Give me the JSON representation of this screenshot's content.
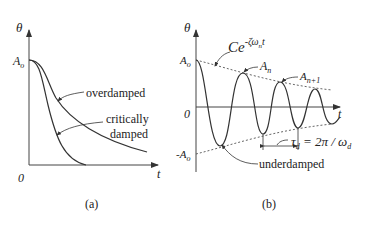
{
  "panel_a": {
    "caption": "(a)",
    "y_axis_label": "θ",
    "x_axis_label": "t",
    "origin_label": "0",
    "amplitude_label": "A",
    "amplitude_sub": "o",
    "curves": [
      {
        "name": "overdamped",
        "label": "overdamped"
      },
      {
        "name": "critically-damped",
        "label_line1": "critically",
        "label_line2": "damped"
      }
    ]
  },
  "panel_b": {
    "caption": "(b)",
    "y_axis_label": "θ",
    "x_axis_label": "t",
    "origin_label": "0",
    "amp_pos": {
      "main": "A",
      "sub": "o"
    },
    "amp_neg": {
      "main": "-A",
      "sub": "o"
    },
    "envelope": {
      "main": "Ce",
      "sup": "-ζω",
      "sup_sub": "n",
      "sup_end": "t"
    },
    "peak_n": {
      "main": "A",
      "sub": "n"
    },
    "peak_n1": {
      "main": "A",
      "sub": "n+1"
    },
    "period": {
      "tau": "τ",
      "tau_sub": "d",
      "eq": " = 2π / ω",
      "omega_sub": "d"
    },
    "curve_label": "underdamped"
  },
  "colors": {
    "ink": "#222222",
    "background": "#ffffff"
  }
}
